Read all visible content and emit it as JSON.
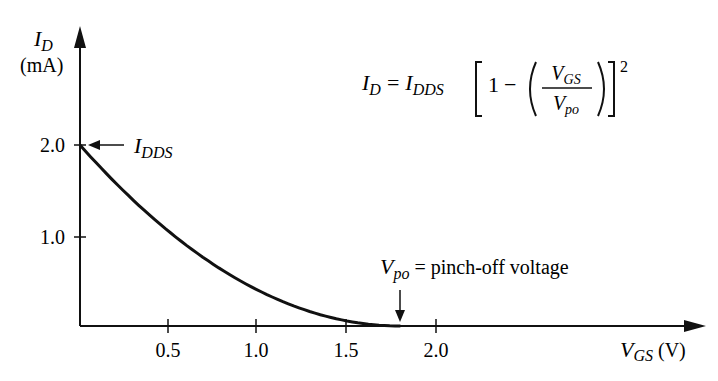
{
  "chart_data": {
    "type": "line",
    "title": "",
    "xlabel": "V_GS (V)",
    "ylabel": "I_D (mA)",
    "xlim": [
      0,
      3.5
    ],
    "ylim": [
      0,
      3.3
    ],
    "grid": false,
    "x_ticks": [
      "0.5",
      "1.0",
      "1.5",
      "2.0"
    ],
    "y_ticks": [
      "1.0",
      "2.0"
    ],
    "series": [
      {
        "name": "I_D vs V_GS",
        "x": [
          0,
          0.2,
          0.4,
          0.6,
          0.8,
          1.0,
          1.2,
          1.4,
          1.6,
          1.8
        ],
        "y": [
          2.0,
          1.58,
          1.21,
          0.89,
          0.62,
          0.4,
          0.22,
          0.1,
          0.025,
          0.0
        ]
      }
    ],
    "annotations": [
      {
        "text": "I_DDS",
        "at": [
          0,
          2.0
        ]
      },
      {
        "text": "V_po = pinch-off voltage",
        "at": [
          1.8,
          0
        ]
      }
    ],
    "equation": "I_D = I_DDS [1 - (V_GS / V_po)]^2",
    "I_DDS": 2.0,
    "V_po": 1.8
  },
  "labels": {
    "y_axis_symbol": "I",
    "y_axis_sub": "D",
    "y_axis_unit": "(mA)",
    "x_axis_symbol": "V",
    "x_axis_sub": "GS",
    "x_axis_unit": " (V)",
    "tick_y_2": "2.0",
    "tick_y_1": "1.0",
    "tick_x_05": "0.5",
    "tick_x_10": "1.0",
    "tick_x_15": "1.5",
    "tick_x_20": "2.0",
    "idds_symbol": "I",
    "idds_sub": "DDS",
    "vpo_symbol": "V",
    "vpo_sub": "po",
    "vpo_text": " = pinch-off voltage",
    "eq_lhs_symbol": "I",
    "eq_lhs_sub": "D",
    "eq_equals": "=",
    "eq_idds_symbol": "I",
    "eq_idds_sub": "DDS",
    "eq_one": "1",
    "eq_minus": "−",
    "eq_num_symbol": "V",
    "eq_num_sub": "GS",
    "eq_den_symbol": "V",
    "eq_den_sub": "po",
    "eq_exp": "2"
  }
}
